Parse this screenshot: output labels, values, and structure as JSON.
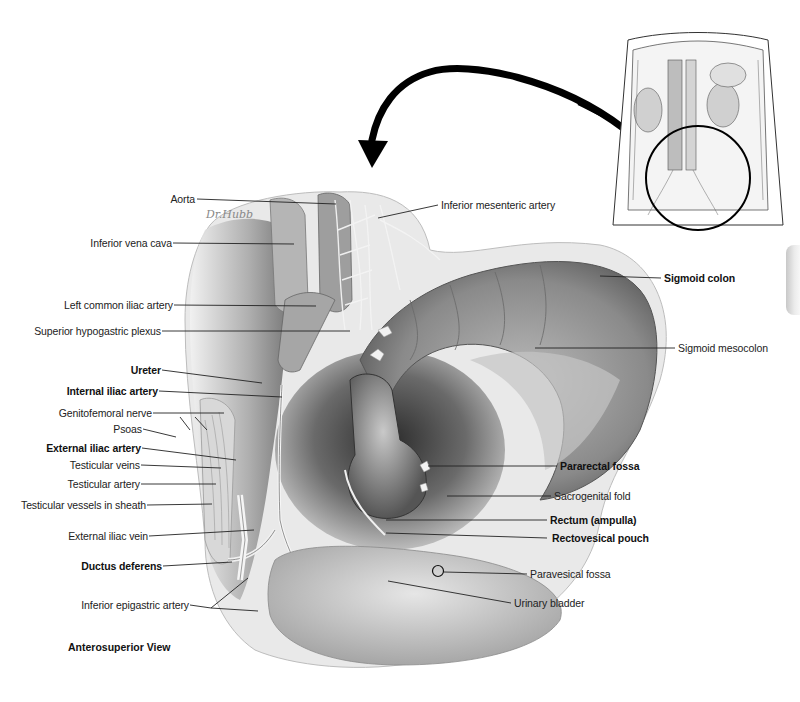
{
  "figure": {
    "view_title": "Anterosuperior View",
    "signature": "Dr.Hubb",
    "colors": {
      "ink": "#111111",
      "leader": "#222222",
      "tissue_dark": "#3a3a3a",
      "tissue_mid": "#8c8c8c",
      "tissue_light": "#d6d6d6",
      "background": "#ffffff"
    },
    "inset": {
      "description": "Orientation inset of abdomen with circled pelvic region",
      "icon": "arrow-curved-left-down"
    },
    "labels_left": [
      {
        "id": "aorta",
        "text": "Aorta",
        "bold": false
      },
      {
        "id": "ivc",
        "text": "Inferior vena cava",
        "bold": false
      },
      {
        "id": "lcia",
        "text": "Left common iliac artery",
        "bold": false
      },
      {
        "id": "shp",
        "text": "Superior hypogastric plexus",
        "bold": false
      },
      {
        "id": "ureter",
        "text": "Ureter",
        "bold": true
      },
      {
        "id": "iia",
        "text": "Internal iliac artery",
        "bold": true
      },
      {
        "id": "gfn",
        "text": "Genitofemoral nerve",
        "bold": false
      },
      {
        "id": "psoas",
        "text": "Psoas",
        "bold": false
      },
      {
        "id": "eia",
        "text": "External iliac artery",
        "bold": true
      },
      {
        "id": "tv",
        "text": "Testicular veins",
        "bold": false
      },
      {
        "id": "ta",
        "text": "Testicular artery",
        "bold": false
      },
      {
        "id": "tvs",
        "text": "Testicular vessels in sheath",
        "bold": false
      },
      {
        "id": "eiv",
        "text": "External iliac vein",
        "bold": false
      },
      {
        "id": "dd",
        "text": "Ductus deferens",
        "bold": true
      },
      {
        "id": "iea",
        "text": "Inferior epigastric artery",
        "bold": false
      }
    ],
    "labels_right": [
      {
        "id": "ima",
        "text": "Inferior mesenteric artery",
        "bold": false
      },
      {
        "id": "sc",
        "text": "Sigmoid colon",
        "bold": true
      },
      {
        "id": "sm",
        "text": "Sigmoid mesocolon",
        "bold": false
      },
      {
        "id": "prf",
        "text": "Pararectal fossa",
        "bold": true
      },
      {
        "id": "sgf",
        "text": "Sacrogenital fold",
        "bold": false
      },
      {
        "id": "ra",
        "text": "Rectum (ampulla)",
        "bold": true
      },
      {
        "id": "rvp",
        "text": "Rectovesical pouch",
        "bold": true
      },
      {
        "id": "pvf",
        "text": "Paravesical fossa",
        "bold": false
      },
      {
        "id": "ub",
        "text": "Urinary bladder",
        "bold": false
      }
    ]
  }
}
